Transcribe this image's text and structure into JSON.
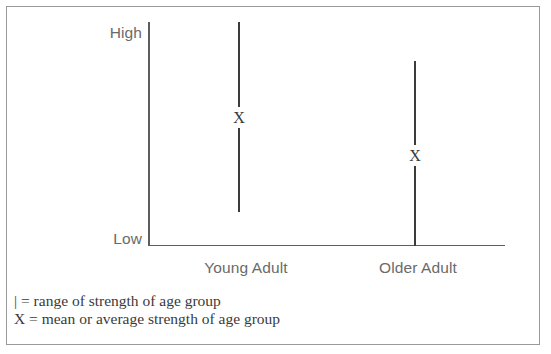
{
  "chart_data": {
    "type": "range",
    "title": "",
    "xlabel": "",
    "ylabel": "",
    "categories": [
      "Young Adult",
      "Older Adult"
    ],
    "y_axis": {
      "low_label": "Low",
      "high_label": "High",
      "scale": "qualitative",
      "range_min": 0,
      "range_max": 100,
      "grid": false
    },
    "series": [
      {
        "name": "range of strength",
        "marker": "|",
        "points": [
          {
            "category": "Young Adult",
            "range_low": 15,
            "range_high": 100,
            "mean": 57
          },
          {
            "category": "Older Adult",
            "range_low": 0,
            "range_high": 82,
            "mean": 40
          }
        ]
      }
    ],
    "legend": {
      "position": "below-plot",
      "entries": [
        {
          "symbol": "|",
          "separator": "=",
          "text": "range of strength of age group"
        },
        {
          "symbol": "X",
          "separator": "=",
          "text": "mean or average strength of age group"
        }
      ]
    },
    "annotations": [
      {
        "label": "X",
        "category": "Young Adult",
        "meaning": "mean"
      },
      {
        "label": "X",
        "category": "Older Adult",
        "meaning": "mean"
      }
    ]
  },
  "axis": {
    "high": "High",
    "low": "Low"
  },
  "categories": {
    "young": "Young Adult",
    "older": "Older Adult"
  },
  "markers": {
    "mean_symbol": "X"
  },
  "legend": {
    "line1": "| = range of strength of age group",
    "line2": "X = mean or average strength of age group"
  },
  "colors": {
    "frame": "#9a9a9a",
    "axis": "#5d5d5d",
    "bar": "#3c3c3c",
    "label_text": "#6a6a6a",
    "legend_text": "#3a3a3a",
    "background": "#ffffff"
  }
}
